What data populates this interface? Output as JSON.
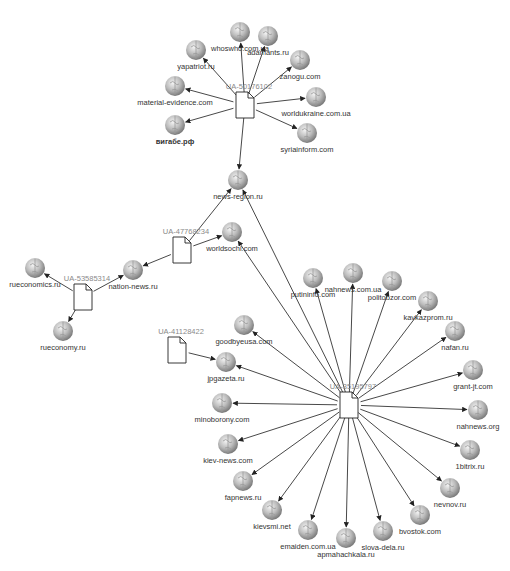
{
  "graph": {
    "hubs": [
      {
        "id": "h1",
        "label": "UA-50176102",
        "x": 245,
        "y": 105
      },
      {
        "id": "h2",
        "label": "UA-47768234",
        "x": 182,
        "y": 250
      },
      {
        "id": "h3",
        "label": "UA-53585314",
        "x": 83,
        "y": 297
      },
      {
        "id": "h4",
        "label": "UA-41128422",
        "x": 177,
        "y": 350
      },
      {
        "id": "h5",
        "label": "UA-35195797",
        "x": 349,
        "y": 405
      }
    ],
    "sites": [
      {
        "id": "s1",
        "label": "whoswho.com.ua",
        "x": 240,
        "y": 32
      },
      {
        "id": "s2",
        "label": "adamants.ru",
        "x": 268,
        "y": 36
      },
      {
        "id": "s3",
        "label": "yapatriot.ru",
        "x": 196,
        "y": 50
      },
      {
        "id": "s4",
        "label": "zanogu.com",
        "x": 300,
        "y": 60
      },
      {
        "id": "s5",
        "label": "material-evidence.com",
        "x": 175,
        "y": 86
      },
      {
        "id": "s6",
        "label": "worldukraine.com.ua",
        "x": 316,
        "y": 97
      },
      {
        "id": "s7",
        "label": "вигабе.рф",
        "x": 175,
        "y": 125
      },
      {
        "id": "s8",
        "label": "syriainform.com",
        "x": 307,
        "y": 133
      },
      {
        "id": "s9",
        "label": "news-region.ru",
        "x": 238,
        "y": 180
      },
      {
        "id": "s10",
        "label": "worldsochi.com",
        "x": 232,
        "y": 232
      },
      {
        "id": "s11",
        "label": "nation-news.ru",
        "x": 133,
        "y": 270
      },
      {
        "id": "s12",
        "label": "rueconomics.ru",
        "x": 35,
        "y": 268
      },
      {
        "id": "s13",
        "label": "rueconomy.ru",
        "x": 63,
        "y": 331
      },
      {
        "id": "s14",
        "label": "putininfo.com",
        "x": 313,
        "y": 278
      },
      {
        "id": "s15",
        "label": "nahnews.com.ua",
        "x": 353,
        "y": 273
      },
      {
        "id": "s16",
        "label": "politobzor.com",
        "x": 392,
        "y": 281
      },
      {
        "id": "s17",
        "label": "kavkazprom.ru",
        "x": 428,
        "y": 301
      },
      {
        "id": "s18",
        "label": "nafan.ru",
        "x": 455,
        "y": 331
      },
      {
        "id": "s19",
        "label": "grant-jt.com",
        "x": 473,
        "y": 370
      },
      {
        "id": "s20",
        "label": "nahnews.org",
        "x": 478,
        "y": 410
      },
      {
        "id": "s21",
        "label": "1bitrix.ru",
        "x": 470,
        "y": 450
      },
      {
        "id": "s22",
        "label": "nevnov.ru",
        "x": 450,
        "y": 488
      },
      {
        "id": "s23",
        "label": "goodbyeusa.com",
        "x": 244,
        "y": 325
      },
      {
        "id": "s24",
        "label": "jpgazeta.ru",
        "x": 226,
        "y": 362
      },
      {
        "id": "s25",
        "label": "minoborony.com",
        "x": 222,
        "y": 403
      },
      {
        "id": "s26",
        "label": "kiev-news.com",
        "x": 228,
        "y": 444
      },
      {
        "id": "s27",
        "label": "fapnews.ru",
        "x": 243,
        "y": 481
      },
      {
        "id": "s28",
        "label": "kievsmi.net",
        "x": 272,
        "y": 510
      },
      {
        "id": "s29",
        "label": "emaiden.com.ua",
        "x": 308,
        "y": 530
      },
      {
        "id": "s30",
        "label": "apmahachkala.ru",
        "x": 346,
        "y": 538
      },
      {
        "id": "s31",
        "label": "slova-dela.ru",
        "x": 383,
        "y": 531
      },
      {
        "id": "s32",
        "label": "bvostok.com",
        "x": 420,
        "y": 515
      }
    ],
    "edges": [
      [
        "h1",
        "s1"
      ],
      [
        "h1",
        "s2"
      ],
      [
        "h1",
        "s3"
      ],
      [
        "h1",
        "s4"
      ],
      [
        "h1",
        "s5"
      ],
      [
        "h1",
        "s6"
      ],
      [
        "h1",
        "s7"
      ],
      [
        "h1",
        "s8"
      ],
      [
        "h1",
        "s9"
      ],
      [
        "h2",
        "s9"
      ],
      [
        "h2",
        "s10"
      ],
      [
        "h2",
        "s11"
      ],
      [
        "h3",
        "s11"
      ],
      [
        "h3",
        "s12"
      ],
      [
        "h3",
        "s13"
      ],
      [
        "h4",
        "s24"
      ],
      [
        "h5",
        "s9"
      ],
      [
        "h5",
        "s10"
      ],
      [
        "h5",
        "s14"
      ],
      [
        "h5",
        "s15"
      ],
      [
        "h5",
        "s16"
      ],
      [
        "h5",
        "s17"
      ],
      [
        "h5",
        "s18"
      ],
      [
        "h5",
        "s19"
      ],
      [
        "h5",
        "s20"
      ],
      [
        "h5",
        "s21"
      ],
      [
        "h5",
        "s22"
      ],
      [
        "h5",
        "s23"
      ],
      [
        "h5",
        "s24"
      ],
      [
        "h5",
        "s25"
      ],
      [
        "h5",
        "s26"
      ],
      [
        "h5",
        "s27"
      ],
      [
        "h5",
        "s28"
      ],
      [
        "h5",
        "s29"
      ],
      [
        "h5",
        "s30"
      ],
      [
        "h5",
        "s31"
      ],
      [
        "h5",
        "s32"
      ]
    ]
  }
}
